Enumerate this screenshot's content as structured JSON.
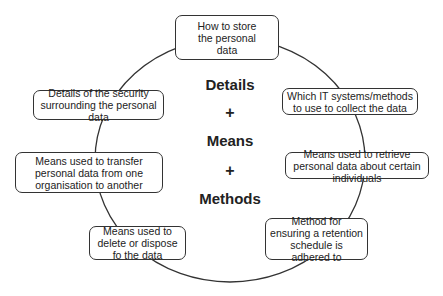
{
  "diagram": {
    "center_terms": [
      "Details",
      "+",
      "Means",
      "+",
      "Methods"
    ],
    "nodes": [
      {
        "id": "store",
        "label": "How to store the personal data"
      },
      {
        "id": "collect",
        "label": "Which IT systems/methods to use to collect the data"
      },
      {
        "id": "retrieve",
        "label": "Means used to retrieve personal data about certain individuals"
      },
      {
        "id": "retention",
        "label": "Method for ensuring a retention schedule is adhered to"
      },
      {
        "id": "delete",
        "label": "Means used to delete or dispose fo the data"
      },
      {
        "id": "transfer",
        "label": "Means used to transfer personal data from one organisation to another"
      },
      {
        "id": "security",
        "label": "Details of the security surrounding the personal data"
      }
    ],
    "colors": {
      "line": "#333333",
      "text": "#222222",
      "background": "#ffffff"
    }
  }
}
